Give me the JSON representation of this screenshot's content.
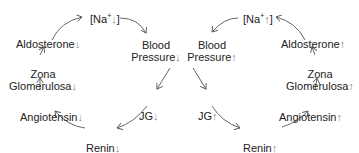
{
  "left_cycle": {
    "na": "[Na",
    "na_sup": "+",
    "na_arrow": "↓",
    "na_close": "]",
    "blood1": "Blood",
    "blood2": "Pressure",
    "blood_arrow": "↓",
    "jg": "JG",
    "jg_arrow": "↓",
    "renin": "Renin",
    "renin_arrow": "↓",
    "angiotensin": "Angiotensin",
    "angiotensin_arrow": "↓",
    "zona1": "Zona",
    "zona2": "Glomerulosa",
    "zona_arrow": "↓",
    "aldosterone": "Aldosterone",
    "aldosterone_arrow": "↓"
  },
  "right_cycle": {
    "na": "[Na",
    "na_sup": "+",
    "na_arrow": "↑",
    "na_close": "]",
    "blood1": "Blood",
    "blood2": "Pressure",
    "blood_arrow": "↑",
    "jg": "JG",
    "jg_arrow": "↑",
    "renin": "Renin",
    "renin_arrow": "↑",
    "angiotensin": "Angiotensin",
    "angiotensin_arrow": "↑",
    "zona1": "Zona",
    "zona2": "Glomerulosa",
    "zona_arrow": "↑",
    "aldosterone": "Aldosterone",
    "aldosterone_arrow": "↑"
  },
  "colors": {
    "line": "#555555",
    "text": "#222222"
  }
}
